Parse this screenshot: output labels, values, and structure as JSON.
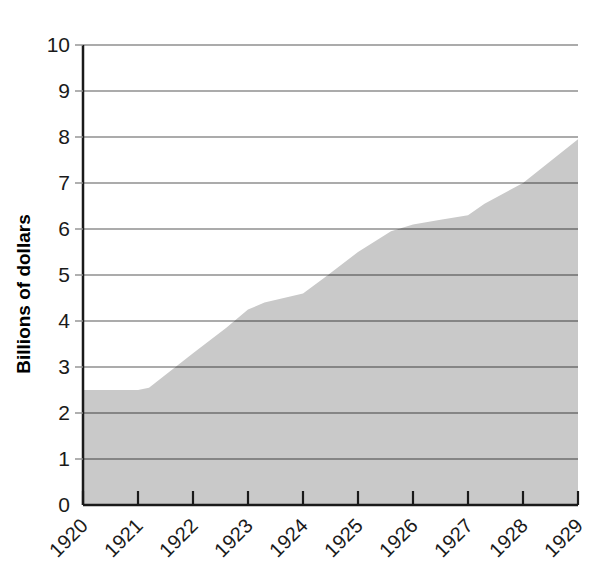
{
  "chart_data": {
    "type": "area",
    "title": "",
    "subtitle": "",
    "xlabel": "",
    "ylabel": "Billions of dollars",
    "categories": [
      "1920",
      "1921",
      "1922",
      "1923",
      "1924",
      "1925",
      "1926",
      "1927",
      "1928",
      "1929"
    ],
    "x": [
      1920,
      1921,
      1922,
      1923,
      1924,
      1925,
      1926,
      1927,
      1928,
      1929
    ],
    "values": [
      2.5,
      2.5,
      3.3,
      4.25,
      4.6,
      5.5,
      6.1,
      6.3,
      7.0,
      7.95
    ],
    "detailed_points": [
      {
        "x": 1920.0,
        "y": 2.5
      },
      {
        "x": 1921.0,
        "y": 2.5
      },
      {
        "x": 1921.2,
        "y": 2.55
      },
      {
        "x": 1922.0,
        "y": 3.3
      },
      {
        "x": 1922.6,
        "y": 3.85
      },
      {
        "x": 1923.0,
        "y": 4.25
      },
      {
        "x": 1923.3,
        "y": 4.4
      },
      {
        "x": 1924.0,
        "y": 4.6
      },
      {
        "x": 1924.4,
        "y": 4.95
      },
      {
        "x": 1925.0,
        "y": 5.5
      },
      {
        "x": 1925.6,
        "y": 5.95
      },
      {
        "x": 1926.0,
        "y": 6.1
      },
      {
        "x": 1926.5,
        "y": 6.2
      },
      {
        "x": 1927.0,
        "y": 6.3
      },
      {
        "x": 1927.3,
        "y": 6.55
      },
      {
        "x": 1928.0,
        "y": 7.0
      },
      {
        "x": 1929.0,
        "y": 7.95
      }
    ],
    "ylim": [
      0,
      10
    ],
    "xlim": [
      1920,
      1929
    ],
    "yticks": [
      "0",
      "1",
      "2",
      "3",
      "4",
      "5",
      "6",
      "7",
      "8",
      "9",
      "10"
    ],
    "ytick_values": [
      0,
      1,
      2,
      3,
      4,
      5,
      6,
      7,
      8,
      9,
      10
    ],
    "grid": true,
    "grid_axis": "y",
    "legend": false,
    "legend_position": "none",
    "series": [
      {
        "name": "Billions of dollars",
        "values": [
          2.5,
          2.5,
          3.3,
          4.25,
          4.6,
          5.5,
          6.1,
          6.3,
          7.0,
          7.95
        ]
      }
    ]
  },
  "style": {
    "fill_color": "#c9c9c9",
    "grid_color_over_fill": "#6e6e6e",
    "grid_color_over_white": "#8f8f8f",
    "axis_color": "#1a1a1a",
    "text_color": "#1a1a1a",
    "background": "#ffffff"
  },
  "geometry": {
    "plot_left": 83,
    "plot_right": 578,
    "plot_top": 45,
    "plot_bottom": 505,
    "x_tick_step_px": 55,
    "y_unit_px": 46
  }
}
